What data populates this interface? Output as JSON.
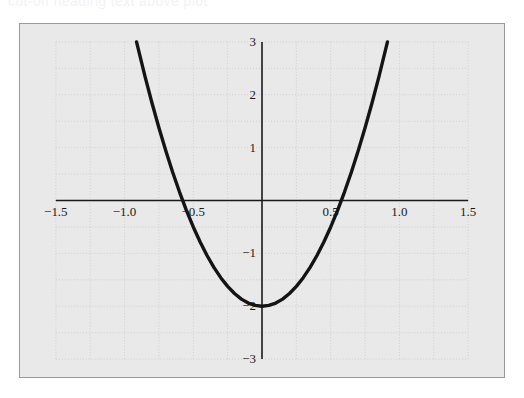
{
  "caption": {
    "text": "cut-off heading text above plot"
  },
  "panel": {
    "background_color": "#e9e9e9",
    "border_color": "#9a9a9a",
    "grid_color": "#cfcfcf",
    "axis_color": "#1a1a1a",
    "curve_color": "#141414"
  },
  "chart_data": {
    "type": "line",
    "title": "",
    "subtitle": "",
    "xlabel": "",
    "ylabel": "",
    "xlim": [
      -1.5,
      1.5
    ],
    "ylim": [
      -3,
      3
    ],
    "grid": true,
    "grid_style": "dotted",
    "grid_x_step": 0.25,
    "grid_y_step": 0.5,
    "legend": null,
    "legend_position": "none",
    "xticks": [
      -1.5,
      -1.0,
      -0.5,
      0.5,
      1.0,
      1.5
    ],
    "xtick_labels": [
      "-1.5",
      "-1.0",
      "-0.5",
      "0.5",
      "1.0",
      "1.5"
    ],
    "yticks": [
      3,
      2,
      1,
      -1,
      -2,
      -3
    ],
    "ytick_labels": [
      "3",
      "2",
      "1",
      "-1",
      "-2",
      "-3"
    ],
    "annotations": [],
    "series": [
      {
        "name": "y = 6x^2 - 2",
        "equation": "y = 6x^2 - 2",
        "vertex": [
          0,
          -2
        ],
        "roots": [
          -0.5774,
          0.5774
        ],
        "x": [
          -0.9129,
          -0.85,
          -0.8,
          -0.75,
          -0.7,
          -0.65,
          -0.6,
          -0.55,
          -0.5,
          -0.45,
          -0.4,
          -0.35,
          -0.3,
          -0.25,
          -0.2,
          -0.15,
          -0.1,
          -0.05,
          0,
          0.05,
          0.1,
          0.15,
          0.2,
          0.25,
          0.3,
          0.35,
          0.4,
          0.45,
          0.5,
          0.55,
          0.6,
          0.65,
          0.7,
          0.75,
          0.8,
          0.85,
          0.9129
        ],
        "values": [
          3,
          2.335,
          1.84,
          1.375,
          0.94,
          0.535,
          0.16,
          -0.185,
          -0.5,
          -0.785,
          -1.04,
          -1.265,
          -1.46,
          -1.625,
          -1.76,
          -1.865,
          -1.94,
          -1.985,
          -2,
          -1.985,
          -1.94,
          -1.865,
          -1.76,
          -1.625,
          -1.46,
          -1.265,
          -1.04,
          -0.785,
          -0.5,
          -0.185,
          0.16,
          0.535,
          0.94,
          1.375,
          1.84,
          2.335,
          3
        ]
      }
    ]
  }
}
